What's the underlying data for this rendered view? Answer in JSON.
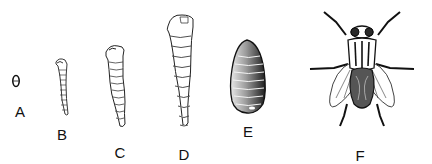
{
  "figure": {
    "stages": [
      {
        "key": "A",
        "label": "A",
        "name": "egg"
      },
      {
        "key": "B",
        "label": "B",
        "name": "young larva"
      },
      {
        "key": "C",
        "label": "C",
        "name": "larva"
      },
      {
        "key": "D",
        "label": "D",
        "name": "mature larva"
      },
      {
        "key": "E",
        "label": "E",
        "name": "pupa"
      },
      {
        "key": "F",
        "label": "F",
        "name": "adult fly"
      }
    ],
    "colors": {
      "ink": "#111111",
      "background": "#ffffff",
      "shade": "#3a3a3a"
    }
  }
}
